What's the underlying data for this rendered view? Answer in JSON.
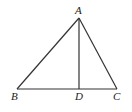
{
  "diagram": {
    "type": "geometry-triangle",
    "line_color": "#333333",
    "points": {
      "A": {
        "label": "A",
        "x": 79,
        "y": 18
      },
      "B": {
        "label": "B",
        "x": 17,
        "y": 89
      },
      "C": {
        "label": "C",
        "x": 117,
        "y": 89
      },
      "D": {
        "label": "D",
        "x": 79,
        "y": 89
      }
    },
    "segments": [
      "AB",
      "AC",
      "BC",
      "AD"
    ]
  }
}
